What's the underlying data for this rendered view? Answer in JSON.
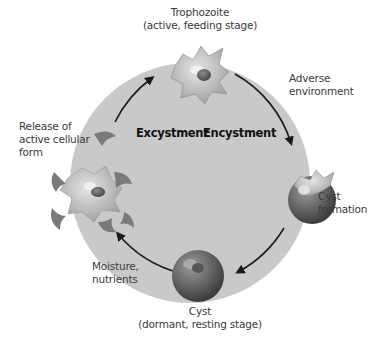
{
  "diagram": {
    "center_labels": {
      "left": "Excystment",
      "right": "Encystment"
    },
    "stages": {
      "trophozoite": {
        "line1": "Trophozoite",
        "line2": "(active, feeding stage)"
      },
      "cyst_formation": {
        "line1": "Cyst",
        "line2": "formation"
      },
      "cyst": {
        "line1": "Cyst",
        "line2": "(dormant, resting stage)"
      },
      "release": {
        "line1": "Release of",
        "line2": "active cellular",
        "line3": "form"
      }
    },
    "conditions": {
      "adverse": {
        "line1": "Adverse",
        "line2": "environment"
      },
      "moisture": {
        "line1": "Moisture,",
        "line2": "nutrients"
      }
    },
    "colors": {
      "circle_fill": "#c9c9c9",
      "arrow": "#1a1a1a",
      "cell_light": "#b5b5b5",
      "cyst_dark": "#5a5a5a"
    }
  }
}
